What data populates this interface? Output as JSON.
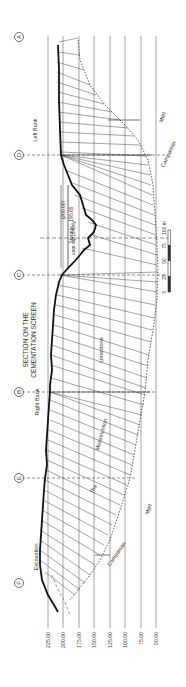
{
  "title": {
    "line1": "SECTION ON THE",
    "line2": "CEMENTATION SCREEN"
  },
  "sections": [
    {
      "id": "A",
      "label": "Ⓐ"
    },
    {
      "id": "D",
      "label": "Ⓓ"
    },
    {
      "id": "C",
      "label": "Ⓒ"
    },
    {
      "id": "B",
      "label": "Ⓑ"
    },
    {
      "id": "E",
      "label": "Ⓔ"
    },
    {
      "id": "F",
      "label": "Ⓕ"
    }
  ],
  "annotations": {
    "left_bank": "Left Bank",
    "right_bank": "Right Bank",
    "excavation": "Excavation",
    "storage": "Storage - 195.65",
    "storage_top": "(200.00)",
    "axis_of_dam": "Axis of the dam",
    "limestone": "Limestone",
    "the": "The",
    "moastrichtion": "Moastrichtion",
    "campanian_1": "Campanian",
    "marl_1": "Marl",
    "campanian_2": "Campanian",
    "marl_2": "Marl"
  },
  "elevation_axis": {
    "ticks": [
      "225.00",
      "200.00",
      "175.00",
      "150.00",
      "125.00",
      "100.00",
      "75.00",
      "50.00"
    ]
  },
  "scale_bar": {
    "labels": [
      "0",
      "25",
      "50",
      "75",
      "100 m"
    ]
  },
  "colors": {
    "ink": "#2a2a2a",
    "grid": "#555555",
    "paper": "#ffffff"
  }
}
